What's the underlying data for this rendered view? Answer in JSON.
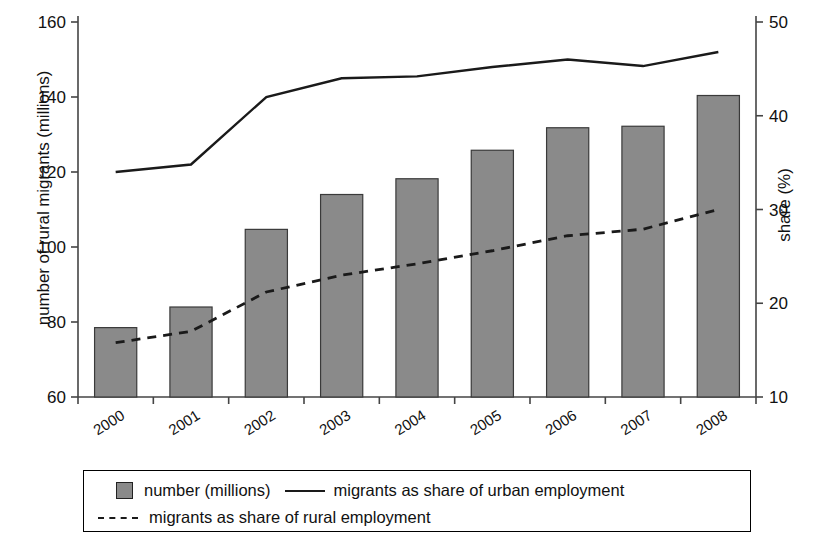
{
  "chart_data": {
    "type": "bar",
    "title": "",
    "categories": [
      "2000",
      "2001",
      "2002",
      "2003",
      "2004",
      "2005",
      "2006",
      "2007",
      "2008"
    ],
    "ylabel": "number of rural migrants (millions)",
    "ylabel_secondary": "share (%)",
    "xlabel": "",
    "ylim": [
      60,
      160
    ],
    "yticks": [
      "60",
      "80",
      "100",
      "120",
      "140",
      "160"
    ],
    "ylim_secondary": [
      10,
      50
    ],
    "yticks_secondary": [
      "10",
      "20",
      "30",
      "40",
      "50"
    ],
    "grid": false,
    "legend_position": "bottom",
    "series": [
      {
        "name": "number (millions)",
        "type": "bar",
        "axis": "left",
        "color": "#8a8a8a",
        "values": [
          78.5,
          84.0,
          104.7,
          114.0,
          118.2,
          125.8,
          131.8,
          132.2,
          140.4
        ]
      },
      {
        "name": "migrants as share of urban employment",
        "type": "line",
        "style": "solid",
        "axis": "right",
        "color": "#1a1a1a",
        "values": [
          34.0,
          34.8,
          42.0,
          44.0,
          44.2,
          45.2,
          46.0,
          45.3,
          46.8
        ]
      },
      {
        "name": "migrants as share of rural employment",
        "type": "line",
        "style": "dashed",
        "axis": "right",
        "color": "#1a1a1a",
        "values": [
          15.8,
          17.0,
          21.2,
          23.0,
          24.2,
          25.6,
          27.2,
          27.9,
          30.0
        ]
      }
    ]
  },
  "legend": {
    "bar_label": "number (millions)",
    "solid_label": "migrants as share of urban employment",
    "dashed_label": "migrants as share of rural employment"
  }
}
